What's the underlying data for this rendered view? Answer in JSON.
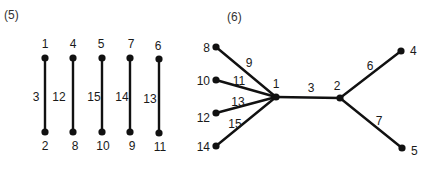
{
  "figures": [
    {
      "caption": "(5)",
      "nodes": [
        {
          "id": "1"
        },
        {
          "id": "2"
        },
        {
          "id": "4"
        },
        {
          "id": "8"
        },
        {
          "id": "5"
        },
        {
          "id": "10"
        },
        {
          "id": "7"
        },
        {
          "id": "9"
        },
        {
          "id": "6"
        },
        {
          "id": "11"
        }
      ],
      "edges": [
        {
          "from": "1",
          "to": "2",
          "label": "3"
        },
        {
          "from": "4",
          "to": "8",
          "label": "12"
        },
        {
          "from": "5",
          "to": "10",
          "label": "15"
        },
        {
          "from": "7",
          "to": "9",
          "label": "14"
        },
        {
          "from": "6",
          "to": "11",
          "label": "13"
        }
      ]
    },
    {
      "caption": "(6)",
      "nodes": [
        {
          "id": "1"
        },
        {
          "id": "2"
        },
        {
          "id": "4"
        },
        {
          "id": "5"
        },
        {
          "id": "8"
        },
        {
          "id": "10"
        },
        {
          "id": "12"
        },
        {
          "id": "14"
        }
      ],
      "edges": [
        {
          "from": "8",
          "to": "1",
          "label": "9"
        },
        {
          "from": "10",
          "to": "1",
          "label": "11"
        },
        {
          "from": "12",
          "to": "1",
          "label": "13"
        },
        {
          "from": "14",
          "to": "1",
          "label": "15"
        },
        {
          "from": "1",
          "to": "2",
          "label": "3"
        },
        {
          "from": "2",
          "to": "4",
          "label": "6"
        },
        {
          "from": "2",
          "to": "5",
          "label": "7"
        }
      ]
    }
  ]
}
